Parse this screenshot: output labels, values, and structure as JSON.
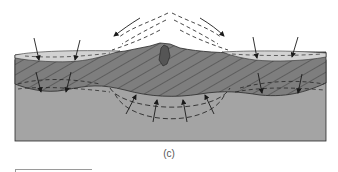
{
  "figure": {
    "panel_label": "(c)",
    "colors": {
      "background": "#ffffff",
      "surface_layer": "#d2d2d2",
      "crust_layer": "#7e7e7e",
      "crust_hatch": "#3c3c3c",
      "mantle_layer": "#a4a4a4",
      "outline": "#2a2a2a",
      "arrow": "#1a1a1a"
    },
    "elements": {
      "surface_layer": "light-gray surface layer with dashed internal line",
      "crust": "hatched dark-gray layer",
      "mantle": "medium-gray lower layer",
      "central_peak": "dark ridge at center",
      "flow_lines_above": "dashed arcs diverging outward from center peak",
      "down_arrows_surface": 4,
      "down_arrows_crust_base": 4,
      "up_arrows_mantle": 4
    }
  }
}
